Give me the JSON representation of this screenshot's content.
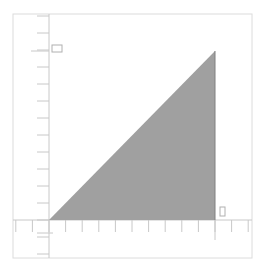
{
  "diagram": {
    "type": "right-triangle-on-axes",
    "colors": {
      "background": "#ffffff",
      "frame": "#dcdcdc",
      "axis": "#c8c8c8",
      "tick": "#c8c8c8",
      "triangle_fill": "#a0a0a0",
      "triangle_edge": "#808080",
      "marker": "#b0b0b0"
    },
    "frame": {
      "x": 13,
      "y": 14,
      "width": 239,
      "height": 244
    },
    "origin": {
      "x": 49,
      "y": 220
    },
    "x_axis": {
      "y": 220,
      "x_start": 13,
      "x_end": 252,
      "tick_spacing": 16.6,
      "tick_length": 12
    },
    "y_axis": {
      "x": 49,
      "y_start": 14,
      "y_end": 258,
      "tick_spacing": 17,
      "tick_length": 12
    },
    "triangle": {
      "vertices": [
        {
          "x": 49,
          "y": 220
        },
        {
          "x": 215,
          "y": 51
        },
        {
          "x": 215,
          "y": 220
        }
      ]
    },
    "markers": [
      {
        "name": "y-marker-box",
        "x": 52,
        "y": 45,
        "width": 10,
        "height": 7
      },
      {
        "name": "x-marker-box",
        "x": 220,
        "y": 207,
        "width": 5,
        "height": 9
      }
    ]
  }
}
